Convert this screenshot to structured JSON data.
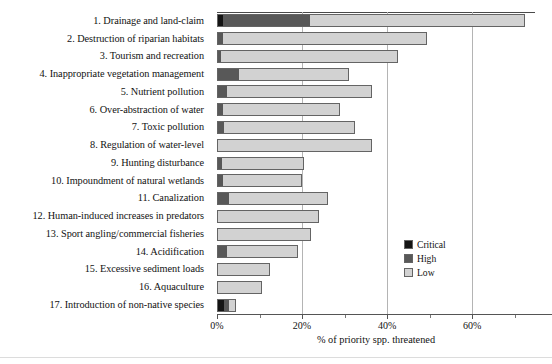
{
  "chart_data": {
    "type": "bar",
    "orientation": "horizontal",
    "stacked": true,
    "title": "",
    "xlabel": "% of priority spp. threatened",
    "ylabel": "",
    "xlim": [
      0,
      74.8
    ],
    "xticks": [
      0,
      20,
      40,
      60
    ],
    "xtick_labels": [
      "0%",
      "20%",
      "40%",
      "60%"
    ],
    "xminor_ticks": [
      10,
      30,
      50,
      70
    ],
    "grid": "vertical-at-major-ticks",
    "legend_position": "inside-lower-right",
    "categories": [
      "1. Drainage and land-claim",
      "2. Destruction of riparian habitats",
      "3. Tourism and recreation",
      "4. Inappropriate vegetation management",
      "5. Nutrient pollution",
      "6. Over-abstraction of water",
      "7. Toxic pollution",
      "8. Regulation of water-level",
      "9. Hunting disturbance",
      "10. Impoundment of natural wetlands",
      "11. Canalization",
      "12. Human-induced increases in predators",
      "13. Sport angling/commercial fisheries",
      "14. Acidification",
      "15. Excessive sediment loads",
      "16. Aquaculture",
      "17. Introduction of non-native species"
    ],
    "series": [
      {
        "name": "Critical",
        "color": "#141414",
        "values": [
          1.2,
          0.0,
          0.0,
          0.0,
          0.0,
          0.0,
          0.0,
          0.0,
          0.0,
          0.0,
          0.0,
          0.0,
          0.0,
          0.0,
          0.0,
          0.0,
          1.5
        ]
      },
      {
        "name": "High",
        "color": "#585858",
        "values": [
          20.5,
          1.2,
          0.8,
          5.0,
          2.0,
          1.2,
          1.3,
          0.0,
          1.0,
          1.2,
          2.6,
          0.0,
          0.0,
          2.0,
          0.0,
          0.0,
          1.2
        ]
      },
      {
        "name": "Low",
        "color": "#d2d2d2",
        "values": [
          50.8,
          48.3,
          41.7,
          26.0,
          34.5,
          27.7,
          31.2,
          36.5,
          19.5,
          18.8,
          23.6,
          24.0,
          22.0,
          17.0,
          12.5,
          10.5,
          1.8
        ]
      }
    ],
    "totals": [
      72.5,
      49.5,
      42.5,
      31.0,
      36.5,
      28.9,
      32.5,
      36.5,
      20.5,
      20.0,
      26.2,
      24.0,
      22.0,
      19.0,
      12.5,
      10.5,
      4.5
    ]
  },
  "legend": {
    "items": [
      {
        "label": "Critical",
        "color": "#141414"
      },
      {
        "label": "High",
        "color": "#585858"
      },
      {
        "label": "Low",
        "color": "#d2d2d2"
      }
    ]
  }
}
